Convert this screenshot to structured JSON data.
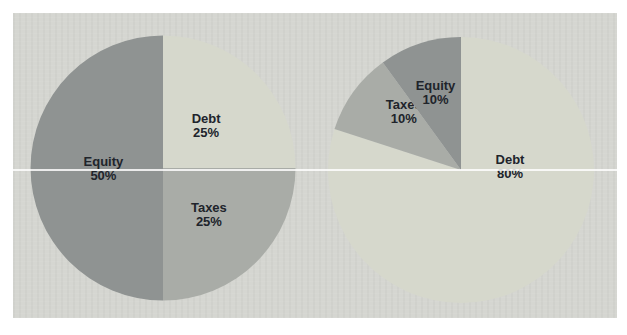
{
  "page": {
    "background": "#ffffff"
  },
  "panel": {
    "background": "#d5d6d1"
  },
  "artifacts": {
    "scan_line_color": "rgba(255,255,255,0.82)"
  },
  "label_text_color": "#20242b",
  "chart_data": [
    {
      "type": "pie",
      "name": "capital-structure-pie-left",
      "title": "",
      "legend": "none",
      "start_angle": 0,
      "direction": "clockwise",
      "slices": [
        {
          "label": "Debt",
          "value": 25,
          "display": "25%",
          "color": "#d6d8cc",
          "label_r_frac": 0.46
        },
        {
          "label": "Taxes",
          "value": 25,
          "display": "25%",
          "color": "#a9aca7",
          "label_r_frac": 0.49
        },
        {
          "label": "Equity",
          "value": 50,
          "display": "50%",
          "color": "#8f9392",
          "label_r_frac": 0.45
        }
      ]
    },
    {
      "type": "pie",
      "name": "capital-structure-pie-right",
      "title": "",
      "legend": "none",
      "start_angle": 0,
      "direction": "clockwise",
      "slices": [
        {
          "label": "Debt",
          "value": 80,
          "display": "80%",
          "color": "#d6d8cc",
          "label_angle": 85,
          "label_r_frac": 0.37
        },
        {
          "label": "Taxes",
          "value": 10,
          "display": "10%",
          "color": "#a9aca7",
          "label_angle": 316,
          "label_r_frac": 0.62
        },
        {
          "label": "Equity",
          "value": 10,
          "display": "10%",
          "color": "#8f9392",
          "label_r_frac": 0.62
        }
      ]
    }
  ]
}
